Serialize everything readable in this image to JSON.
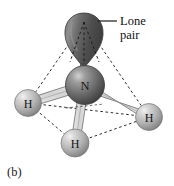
{
  "figure": {
    "caption": "(b)",
    "molecule_name": "ammonia-tetrahedral-model",
    "annotation": {
      "line1": "Lone",
      "line2": "pair"
    },
    "atoms": [
      {
        "symbol": "N",
        "role": "central-atom",
        "cx": 85,
        "cy": 85,
        "r": 19.5,
        "fill": "#6d6d6d",
        "highlight": "#c9c9c9"
      },
      {
        "symbol": "H",
        "role": "hydrogen-left",
        "cx": 28,
        "cy": 103,
        "r": 13.5,
        "fill": "#b5b5b5",
        "highlight": "#ececec"
      },
      {
        "symbol": "H",
        "role": "hydrogen-right",
        "cx": 149,
        "cy": 117,
        "r": 13.5,
        "fill": "#b5b5b5",
        "highlight": "#ececec"
      },
      {
        "symbol": "H",
        "role": "hydrogen-bottom",
        "cx": 75,
        "cy": 143,
        "r": 14.0,
        "fill": "#b5b5b5",
        "highlight": "#ececec"
      }
    ],
    "lone_pair_lobe": {
      "apex_x": 84,
      "apex_y": 68,
      "top_y": 13,
      "fill": "#585858"
    },
    "colors": {
      "background": "#ffffff",
      "nitrogen": "#6d6d6d",
      "hydrogen": "#b5b5b5",
      "lobe": "#585858",
      "bond": "#c6c6c6",
      "bond_outline": "#4a4a4a",
      "dashed_edge": "#2b2b2b",
      "text": "#111111"
    }
  }
}
